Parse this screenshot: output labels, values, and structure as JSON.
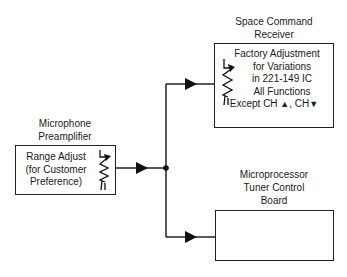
{
  "diagram": {
    "blocks": {
      "mic": {
        "title_line1": "Microphone",
        "title_line2": "Preamplifier",
        "lines": [
          "Range Adjust",
          "(for Customer",
          "Preference)"
        ],
        "symbol": "variable-resistor-icon"
      },
      "space": {
        "title_line1": "Space Command",
        "title_line2": "Receiver",
        "lines": [
          "Factory Adjustment",
          "for Variations",
          "in 221-149 IC",
          "All Functions"
        ],
        "last_line_prefix": "Except CH",
        "last_line_sep": ", CH",
        "up_glyph": "▲",
        "down_glyph": "▼",
        "symbol": "variable-resistor-icon"
      },
      "tuner": {
        "title_line1": "Microprocessor",
        "title_line2": "Tuner Control",
        "title_line3": "Board",
        "lines": []
      }
    },
    "connections": [
      {
        "from": "mic",
        "to": "junction"
      },
      {
        "from": "junction",
        "to": "space"
      },
      {
        "from": "junction",
        "to": "tuner"
      }
    ],
    "colors": {
      "line": "#222222",
      "background": "#ffffff"
    }
  }
}
